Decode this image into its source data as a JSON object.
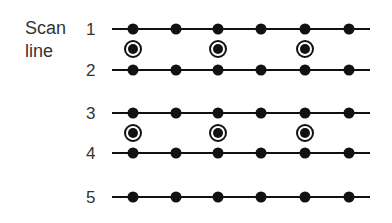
{
  "title": {
    "line1": "Scan",
    "line2": "line"
  },
  "scan_lines": [
    {
      "label": "1",
      "y": 29
    },
    {
      "label": "2",
      "y": 70
    },
    {
      "label": "3",
      "y": 113
    },
    {
      "label": "4",
      "y": 153
    },
    {
      "label": "5",
      "y": 197
    }
  ],
  "dot_x": [
    133,
    176,
    218,
    261,
    305,
    349
  ],
  "line_x_start": 112,
  "line_x_end": 370,
  "ringed_points": [
    {
      "x": 133,
      "y": 49
    },
    {
      "x": 218,
      "y": 49
    },
    {
      "x": 305,
      "y": 49
    },
    {
      "x": 133,
      "y": 133
    },
    {
      "x": 218,
      "y": 133
    },
    {
      "x": 305,
      "y": 133
    }
  ],
  "colors": {
    "ink": "#111111",
    "text": "#333333"
  }
}
